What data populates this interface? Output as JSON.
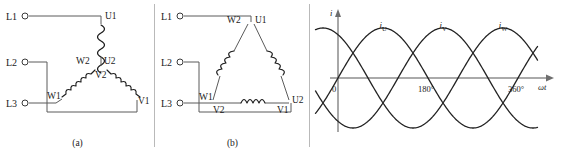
{
  "figure": {
    "panels": [
      {
        "id": "a",
        "caption": "(a)",
        "name": "delta-connection-diagram-a",
        "supply_terminals": [
          {
            "label": "L1"
          },
          {
            "label": "L2"
          },
          {
            "label": "L3"
          }
        ],
        "winding_nodes": [
          {
            "label": "U1"
          },
          {
            "label": "W2"
          },
          {
            "label": "U2"
          },
          {
            "label": "V2"
          },
          {
            "label": "W1"
          },
          {
            "label": "V1"
          }
        ]
      },
      {
        "id": "b",
        "caption": "(b)",
        "name": "delta-connection-diagram-b",
        "supply_terminals": [
          {
            "label": "L1"
          },
          {
            "label": "L2"
          },
          {
            "label": "L3"
          }
        ],
        "winding_nodes": [
          {
            "label": "W2"
          },
          {
            "label": "U1"
          },
          {
            "label": "W1"
          },
          {
            "label": "V2"
          },
          {
            "label": "V1"
          },
          {
            "label": "U2"
          }
        ]
      }
    ]
  },
  "chart_data": {
    "type": "line",
    "title": "",
    "xlabel": "ωt",
    "ylabel": "i",
    "xlim": [
      -40,
      430
    ],
    "ylim": [
      -1.25,
      1.25
    ],
    "grid": false,
    "legend": "inline-curve-labels",
    "xticks": [
      {
        "value": 0,
        "label": "0"
      },
      {
        "value": 180,
        "label": "180°"
      },
      {
        "value": 360,
        "label": "360°"
      }
    ],
    "series": [
      {
        "name": "i_U",
        "label": "i",
        "sub": "U",
        "phase_deg": 0,
        "amplitude": 1,
        "values": [
          0,
          0.5,
          0.87,
          1,
          0.87,
          0.5,
          0,
          -0.5,
          -0.87,
          -1,
          -0.87,
          -0.5,
          0,
          0.5,
          0.87,
          1,
          0.87,
          0.5,
          0,
          -0.5,
          -0.87,
          -1,
          -0.87,
          -0.5,
          0
        ]
      },
      {
        "name": "i_V",
        "label": "i",
        "sub": "V",
        "phase_deg": -120,
        "amplitude": 1,
        "values": [
          -0.87,
          -0.5,
          0,
          0.5,
          0.87,
          1,
          0.87,
          0.5,
          0,
          -0.5,
          -0.87,
          -1,
          -0.87,
          -0.5,
          0,
          0.5,
          0.87,
          1,
          0.87,
          0.5,
          0,
          -0.5,
          -0.87,
          -1,
          -0.87
        ]
      },
      {
        "name": "i_W",
        "label": "i",
        "sub": "W",
        "phase_deg": 120,
        "amplitude": 1,
        "values": [
          0.87,
          1,
          0.87,
          0.5,
          0,
          -0.5,
          -0.87,
          -1,
          -0.87,
          -0.5,
          0,
          0.5,
          0.87,
          1,
          0.87,
          0.5,
          0,
          -0.5,
          -0.87,
          -1,
          -0.87,
          -0.5,
          0,
          0.5,
          0.87
        ]
      }
    ],
    "curve_label_positions": [
      {
        "series": "i_U",
        "x": 90
      },
      {
        "series": "i_V",
        "x": 210
      },
      {
        "series": "i_W",
        "x": 330
      }
    ]
  },
  "colors": {
    "wire": "#5b5b5b",
    "coil": "#1d1d1d",
    "axis": "#8e8e8e",
    "wave": "#232323",
    "text": "#1a1a1a",
    "background": "#ffffff"
  }
}
